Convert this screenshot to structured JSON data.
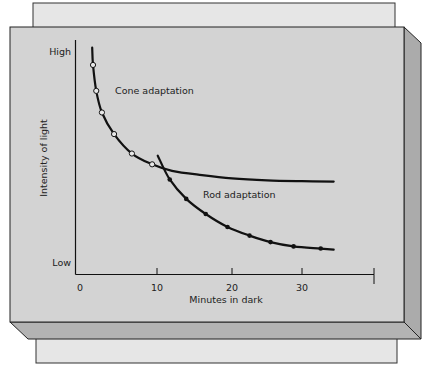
{
  "chart_data": {
    "type": "line",
    "title": "",
    "xlabel": "Minutes in dark",
    "ylabel": "Intensity of light",
    "x_ticks": [
      {
        "value": 0,
        "label": "0"
      },
      {
        "value": 10,
        "label": "10"
      },
      {
        "value": 20,
        "label": "20"
      },
      {
        "value": 30,
        "label": "30"
      },
      {
        "value": 40,
        "label": ""
      }
    ],
    "y_ticks": [
      {
        "value": 0,
        "label": "Low"
      },
      {
        "value": 100,
        "label": "High"
      }
    ],
    "xlim": [
      0,
      40
    ],
    "ylim": [
      0,
      100
    ],
    "grid": false,
    "series": [
      {
        "name": "Cone adaptation",
        "marker": "open-circle",
        "curve": [
          [
            2.0,
            102
          ],
          [
            2.1,
            94
          ],
          [
            2.5,
            82
          ],
          [
            3.2,
            72
          ],
          [
            4.7,
            62
          ],
          [
            6.9,
            53
          ],
          [
            9.4,
            48
          ],
          [
            12,
            45
          ],
          [
            16,
            43
          ],
          [
            20,
            41.5
          ],
          [
            25,
            40.6
          ],
          [
            30,
            40.2
          ],
          [
            34.4,
            40
          ]
        ],
        "points": [
          [
            2.1,
            94
          ],
          [
            2.5,
            82
          ],
          [
            3.2,
            72
          ],
          [
            4.7,
            62
          ],
          [
            6.9,
            53
          ],
          [
            9.4,
            48
          ]
        ],
        "annotation": "Cone adaptation"
      },
      {
        "name": "Rod adaptation",
        "marker": "filled-dot",
        "curve": [
          [
            10.1,
            52
          ],
          [
            11.7,
            41
          ],
          [
            13.9,
            32
          ],
          [
            16.5,
            25
          ],
          [
            19.4,
            19
          ],
          [
            22.5,
            15
          ],
          [
            25.5,
            12
          ],
          [
            28.8,
            10
          ],
          [
            32.6,
            9
          ],
          [
            34.4,
            8.5
          ]
        ],
        "points": [
          [
            11.7,
            41
          ],
          [
            13.9,
            32
          ],
          [
            16.5,
            25
          ],
          [
            19.4,
            19
          ],
          [
            22.5,
            15
          ],
          [
            25.5,
            12
          ],
          [
            28.8,
            10
          ],
          [
            32.6,
            9
          ]
        ],
        "annotation": "Rod adaptation"
      }
    ]
  },
  "colors": {
    "front_face": "#d3d3d3",
    "side_face": "#ababab",
    "bottom_face": "#b3b3b3",
    "back_panel": "#e6e6e6",
    "ink": "#111111"
  }
}
